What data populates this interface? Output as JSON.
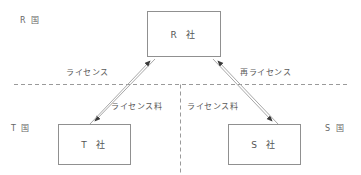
{
  "diagram": {
    "background_color": "#ffffff",
    "line_color": "#909090",
    "text_color": "#555555",
    "nodes": [
      {
        "id": "r",
        "label": "R 社",
        "name": "node-company-r"
      },
      {
        "id": "t",
        "label": "T 社",
        "name": "node-company-t"
      },
      {
        "id": "s",
        "label": "S 社",
        "name": "node-company-s"
      }
    ],
    "regions": [
      {
        "id": "r-country",
        "label": "R 国"
      },
      {
        "id": "t-country",
        "label": "T 国"
      },
      {
        "id": "s-country",
        "label": "S 国"
      }
    ],
    "edge_labels": {
      "license": "ライセンス",
      "sublicense": "再ライセンス",
      "license_fee_left": "ライセンス料",
      "license_fee_right": "ライセンス料"
    },
    "dividers": {
      "horizontal": "country-border-horizontal",
      "vertical": "country-border-vertical"
    }
  }
}
